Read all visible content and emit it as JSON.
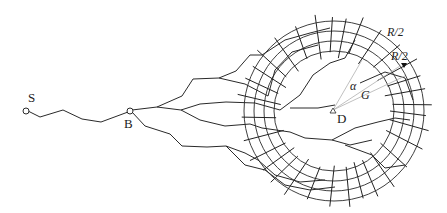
{
  "diagram": {
    "type": "network-propagation-diagram",
    "labels": {
      "source": "S",
      "branch": "B",
      "destination": "D",
      "outer_band": "R/2",
      "inner_band": "R/2",
      "angle": "α",
      "geo": "G"
    },
    "nodes": [
      {
        "id": "S",
        "x": 26,
        "y": 111,
        "shape": "circle"
      },
      {
        "id": "B",
        "x": 130,
        "y": 111,
        "shape": "circle"
      },
      {
        "id": "D",
        "x": 333,
        "y": 112,
        "shape": "triangle"
      }
    ],
    "rings": {
      "center": [
        334,
        111
      ],
      "radii": [
        90,
        80,
        70,
        60
      ]
    },
    "colors": {
      "stroke": "#2a2a2a",
      "ray": "#b0b0b0",
      "background": "#ffffff"
    }
  }
}
